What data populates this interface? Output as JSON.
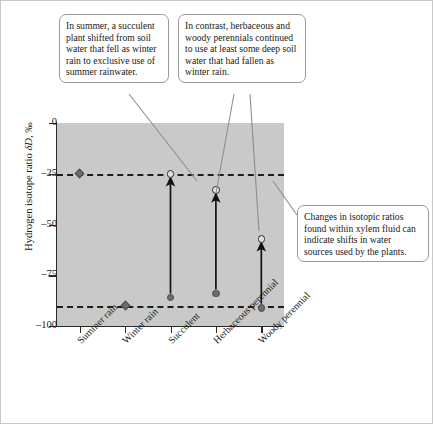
{
  "chart_data": {
    "type": "scatter",
    "title": "",
    "xlabel": "",
    "ylabel": "Hydrogen isotope ratio δD, ‰",
    "ylim": [
      -100,
      0
    ],
    "ytick_values": [
      0,
      -25,
      -50,
      -75,
      -100
    ],
    "ytick_labels": [
      "0",
      "–25",
      "–50",
      "–75",
      "–100"
    ],
    "grid": false,
    "legend_position": "none",
    "plot_background": "#c9c9c9",
    "categories": [
      "Summer rain",
      "Winter rain",
      "Succulent",
      "Herbaceous perennial",
      "Woody perennial"
    ],
    "reference_lines": [
      {
        "name": "summer-rain-reference",
        "value": -25,
        "style": "dashed",
        "label": "Summer rain δD ≈ –25‰"
      },
      {
        "name": "winter-rain-reference",
        "value": -90,
        "style": "dashed",
        "label": "Winter rain δD ≈ –90‰"
      }
    ],
    "series": [
      {
        "name": "Rainfall source (δD of rain)",
        "marker": "filled-diamond",
        "points": [
          {
            "category": "Summer rain",
            "value": -25
          },
          {
            "category": "Winter rain",
            "value": -90
          }
        ]
      },
      {
        "name": "Xylem water, winter (pre-shift)",
        "marker": "filled-circle",
        "points": [
          {
            "category": "Succulent",
            "value": -86
          },
          {
            "category": "Herbaceous perennial",
            "value": -84
          },
          {
            "category": "Woody perennial",
            "value": -91
          }
        ]
      },
      {
        "name": "Xylem water, summer (post-shift)",
        "marker": "open-circle",
        "points": [
          {
            "category": "Succulent",
            "value": -25
          },
          {
            "category": "Herbaceous perennial",
            "value": -33
          },
          {
            "category": "Woody perennial",
            "value": -57
          }
        ]
      }
    ],
    "shift_arrows": [
      {
        "category": "Succulent",
        "from": -86,
        "to": -25,
        "direction": "up"
      },
      {
        "category": "Herbaceous perennial",
        "from": -84,
        "to": -33,
        "direction": "up"
      },
      {
        "category": "Woody perennial",
        "from": -91,
        "to": -57,
        "direction": "up"
      }
    ],
    "annotations": [
      {
        "id": "callout-1",
        "text": "In summer, a succulent plant shifted from soil water that fell as winter rain to exclusive use of summer rainwater.",
        "points_to": [
          "Succulent summer xylem value (–25‰)"
        ]
      },
      {
        "id": "callout-2",
        "text": "In contrast, herbaceous and woody perennials continued to use at least some deep soil water that had fallen as winter rain.",
        "points_to": [
          "Herbaceous perennial summer xylem value (–33‰)",
          "Woody perennial summer xylem value (–57‰)"
        ]
      },
      {
        "id": "callout-3",
        "text": "Changes in isotopic ratios found within xylem fluid can indicate shifts in water sources used by the plants.",
        "points_to": [
          "Summer rain reference line (–25‰)"
        ]
      }
    ]
  },
  "axis": {
    "y_title_pre": "Hydrogen isotope ratio ",
    "y_title_delta": "δD",
    "y_title_post": ", ‰"
  }
}
